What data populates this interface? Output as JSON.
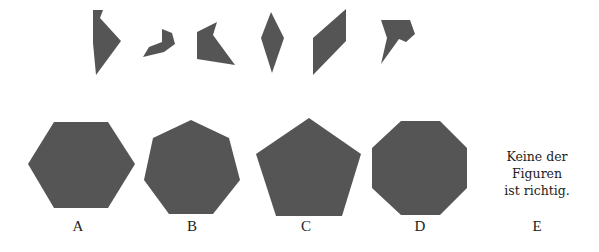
{
  "question": {
    "fragments": [
      {
        "id": "fragment-1",
        "points": "93,10 103,10 100,18 121,41 96,75 93,43"
      },
      {
        "id": "fragment-2",
        "points": "162,29 172,33 175,44 164,52 143,57 149,47 162,42"
      },
      {
        "id": "fragment-3",
        "points": "197,32 217,22 213,35 235,65 197,59"
      },
      {
        "id": "fragment-4",
        "points": "271,12 284,38 272,73 261,38"
      },
      {
        "id": "fragment-5",
        "points": "346,9 346,41 313,75 313,38"
      },
      {
        "id": "fragment-6",
        "points": "381,20 410,20 415,34 406,42 399,39 394,46 381,64 387,38"
      }
    ]
  },
  "options": [
    {
      "id": "A",
      "label": "A",
      "shape": "hexagon",
      "center": [
        87,
        165
      ],
      "points": "54,122 108,122 135,164 108,208 54,208 28,164"
    },
    {
      "id": "B",
      "label": "B",
      "shape": "heptagon",
      "center": [
        191,
        166
      ],
      "points": "191,120 229,138 240,180 213,214 169,214 144,180 153,138"
    },
    {
      "id": "C",
      "label": "C",
      "shape": "pentagon",
      "center": [
        306,
        168
      ],
      "points": "309,118 361,154 342,216 276,216 256,154"
    },
    {
      "id": "D",
      "label": "D",
      "shape": "octagon",
      "center": [
        419,
        167
      ],
      "points": "401,121 440,121 467,148 467,188 440,215 401,215 372,188 372,148"
    },
    {
      "id": "E",
      "label": "E",
      "text_lines": [
        "Keine der",
        "Figuren",
        "ist richtig."
      ]
    }
  ],
  "colors": {
    "shape_fill": "#555555",
    "text": "#222222",
    "background": "#ffffff"
  }
}
